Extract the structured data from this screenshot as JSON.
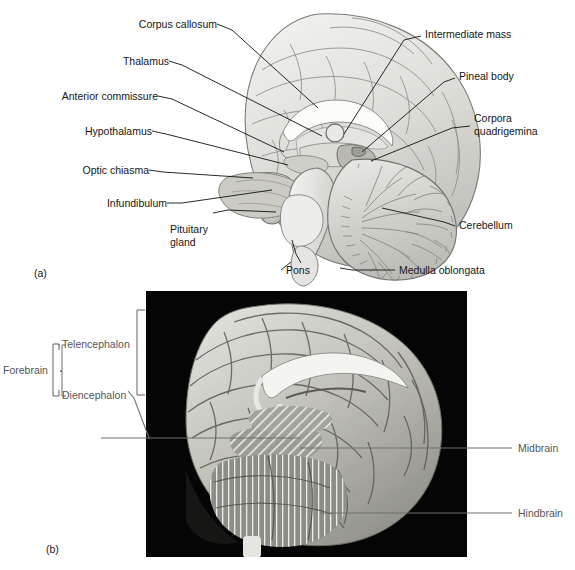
{
  "figure": {
    "panels": [
      {
        "tag": "(a)",
        "type": "illustration"
      },
      {
        "tag": "(b)",
        "type": "photograph"
      }
    ]
  },
  "panel_a": {
    "tag": "(a)",
    "labels_left": [
      {
        "text": "Corpus callosum",
        "id": "corpus-callosum"
      },
      {
        "text": "Thalamus",
        "id": "thalamus"
      },
      {
        "text": "Anterior commissure",
        "id": "anterior-commissure"
      },
      {
        "text": "Hypothalamus",
        "id": "hypothalamus"
      },
      {
        "text": "Optic chiasma",
        "id": "optic-chiasma"
      },
      {
        "text": "Infundibulum",
        "id": "infundibulum"
      },
      {
        "text": "Pituitary\ngland",
        "id": "pituitary-gland"
      },
      {
        "text": "Pons",
        "id": "pons"
      }
    ],
    "labels_right": [
      {
        "text": "Intermediate mass",
        "id": "intermediate-mass"
      },
      {
        "text": "Pineal body",
        "id": "pineal-body"
      },
      {
        "text": "Corpora\nquadrigemina",
        "id": "corpora-quadrigemina"
      },
      {
        "text": "Cerebellum",
        "id": "cerebellum"
      },
      {
        "text": "Medulla oblongata",
        "id": "medulla-oblongata"
      }
    ]
  },
  "panel_b": {
    "tag": "(b)",
    "bracket_labels": [
      {
        "text": "Forebrain",
        "id": "forebrain"
      },
      {
        "text": "Telencephalon",
        "id": "telencephalon"
      },
      {
        "text": "Diencephalon",
        "id": "diencephalon"
      }
    ],
    "region_labels": [
      {
        "text": "Midbrain",
        "id": "midbrain",
        "pattern": "diagonal-hatch"
      },
      {
        "text": "Hindbrain",
        "id": "hindbrain",
        "pattern": "vertical-hatch"
      }
    ]
  },
  "colors": {
    "text": "#161616",
    "gray_text": "#555555",
    "leader_line": "#111111",
    "photo_background": "#000000",
    "brain_tissue": "#d8d8d4"
  }
}
